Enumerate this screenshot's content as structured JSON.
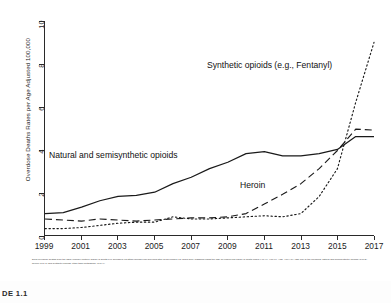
{
  "exhibit": {
    "tag": "DE 1.1"
  },
  "footnote": {
    "text": "Drug overdose deaths from the CDC Wonder Multiple Cause of Death File accessed via https://wonder.cdc.gov/mcd.html on December 18, 2018 were classified using the ICD-10 underlying cause of death codes X40-44, X60-64, X85, Y10-Y14 AND one of the following: natural and semisynthetic opioids (T40.2), heroin (T40.1) and synthetic opioids, other than methadone (T40.4)."
  },
  "chart_data": {
    "type": "line",
    "title": "",
    "xlabel": "",
    "ylabel": "Overdose Deaths Rates per Age Adjusted 100,000",
    "xlim": [
      1999,
      2017
    ],
    "ylim": [
      0,
      10
    ],
    "yticks": [
      0,
      2,
      4,
      6,
      8,
      10
    ],
    "xticks": [
      1999,
      2001,
      2003,
      2005,
      2007,
      2009,
      2011,
      2013,
      2015,
      2017
    ],
    "grid": false,
    "legend_position": "inline-annotations",
    "x": [
      1999,
      2000,
      2001,
      2002,
      2003,
      2004,
      2005,
      2006,
      2007,
      2008,
      2009,
      2010,
      2011,
      2012,
      2013,
      2014,
      2015,
      2016,
      2017
    ],
    "series": [
      {
        "name": "Natural and semisynthetic opioids",
        "style": "solid",
        "color": "#1a1a1a",
        "values": [
          1.0,
          1.05,
          1.3,
          1.6,
          1.8,
          1.85,
          2.0,
          2.4,
          2.7,
          3.1,
          3.4,
          3.8,
          3.9,
          3.7,
          3.7,
          3.8,
          4.0,
          4.6,
          4.6
        ]
      },
      {
        "name": "Heroin",
        "style": "dashed",
        "color": "#1a1a1a",
        "values": [
          0.75,
          0.7,
          0.65,
          0.75,
          0.7,
          0.65,
          0.7,
          0.75,
          0.8,
          0.8,
          0.85,
          1.0,
          1.45,
          1.9,
          2.4,
          3.1,
          3.95,
          4.95,
          4.9
        ]
      },
      {
        "name": "Synthetic opioids (e.g., Fentanyl)",
        "style": "dotted",
        "color": "#1a1a1a",
        "values": [
          0.3,
          0.3,
          0.35,
          0.45,
          0.55,
          0.6,
          0.6,
          0.85,
          0.75,
          0.75,
          0.8,
          0.85,
          0.9,
          0.85,
          1.0,
          1.8,
          3.1,
          6.2,
          9.0
        ]
      }
    ],
    "annotations": [
      {
        "id": "synthetic",
        "text": "Synthetic opioids (e.g., Fentanyl)"
      },
      {
        "id": "natural",
        "text": "Natural and semisynthetic opioids"
      },
      {
        "id": "heroin",
        "text": "Heroin"
      }
    ]
  }
}
